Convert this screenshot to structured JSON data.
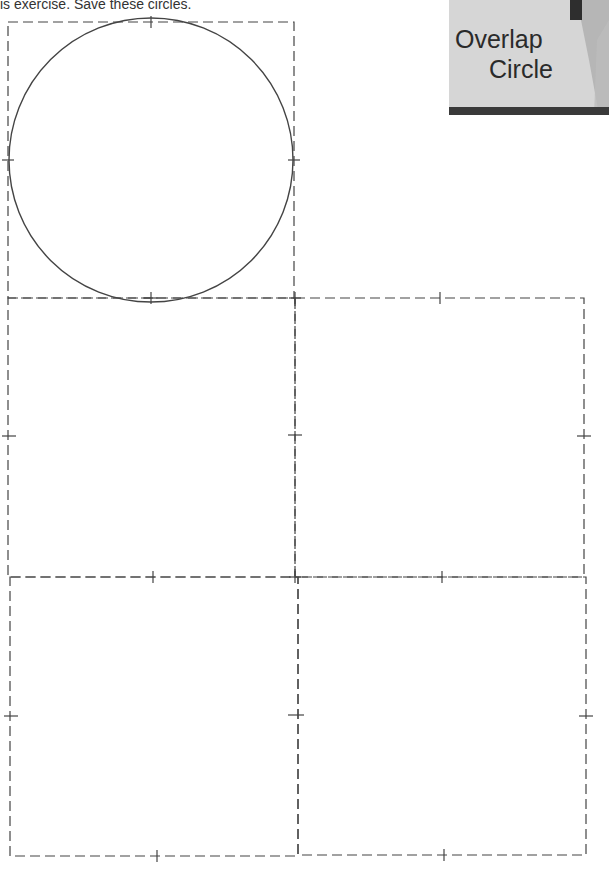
{
  "instruction": {
    "text": "is exercise. Save these circles."
  },
  "title_card": {
    "line1": "Overlap",
    "line2": "Circle",
    "background": "#d6d6d6",
    "bar_color": "#3a3a3a"
  },
  "template": {
    "line_color": "#444444",
    "dash_pattern": "10,5",
    "circle": {
      "cx": 151,
      "cy": 160,
      "r": 142,
      "stroke": "#444444"
    },
    "panels": [
      {
        "name": "top-left-square",
        "x": 8,
        "y": 22,
        "w": 286,
        "h": 276
      },
      {
        "name": "middle-left-square",
        "x": 8,
        "y": 298,
        "w": 287,
        "h": 279
      },
      {
        "name": "middle-right-square",
        "x": 295,
        "y": 298,
        "w": 289,
        "h": 279
      },
      {
        "name": "bottom-left-square",
        "x": 10,
        "y": 577,
        "w": 288,
        "h": 279
      },
      {
        "name": "bottom-right-square",
        "x": 298,
        "y": 577,
        "w": 288,
        "h": 278
      }
    ]
  }
}
